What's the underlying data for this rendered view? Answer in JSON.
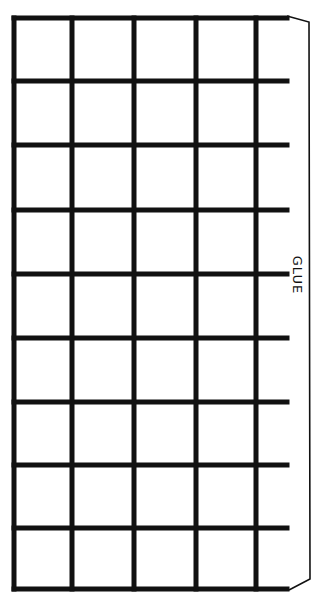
{
  "diagram": {
    "type": "paper-craft-template",
    "grid": {
      "columns": 5,
      "rows": 9,
      "x_lines": [
        14,
        72,
        134,
        196,
        256
      ],
      "y_lines": [
        18,
        81,
        145,
        210,
        274,
        338,
        402,
        465,
        528,
        589
      ],
      "line_end_x": 287,
      "line_color": "#111111",
      "line_width": 5
    },
    "glue_flap": {
      "label": "GLUE",
      "outline_color": "#111111"
    }
  }
}
